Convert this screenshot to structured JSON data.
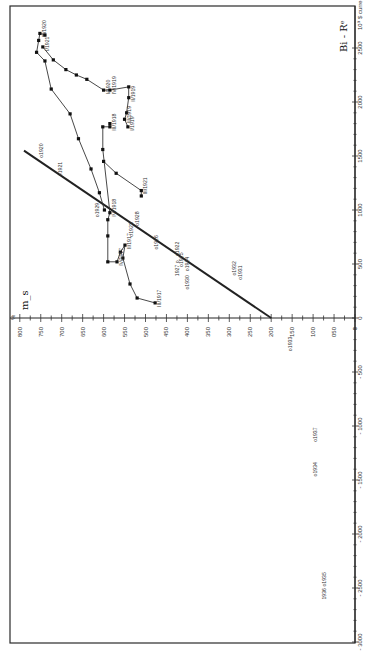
{
  "chart_data": {
    "type": "line",
    "orientation": "rotated-90-ccw",
    "title": "",
    "xlabel": "Bi - R^e  (× 10^9)",
    "ylabel": "m_s (%)",
    "x_axis": {
      "label": "Bi - Rᵉ",
      "unit_label": "10⁹ $ current",
      "ticks": [
        2500,
        2000,
        1500,
        1000,
        500,
        0,
        -500,
        -1000,
        -1500,
        -2000,
        -2500,
        -3000
      ],
      "tick_labels": [
        "2500",
        "2000",
        "1500",
        "1000",
        "500",
        "0",
        "- 500",
        "- 1000",
        "- 1500",
        "- 2000",
        "- 2500",
        "- 3000"
      ],
      "range": [
        -3000,
        2600
      ]
    },
    "y_axis": {
      "label": "m_s",
      "unit_label": "%",
      "ticks": [
        800,
        750,
        700,
        650,
        600,
        550,
        500,
        450,
        400,
        350,
        300,
        250,
        200,
        150,
        100,
        50,
        0
      ],
      "tick_labels": [
        "800",
        "750",
        "700",
        "650",
        "600",
        "550",
        "500",
        "450",
        "400",
        "350",
        "300",
        "250",
        "200",
        "150",
        "100",
        "050",
        "0"
      ],
      "range": [
        0,
        800
      ]
    },
    "reference_line": {
      "from": {
        "x": 0,
        "y": 200
      },
      "to": {
        "x": 1550,
        "y": 790
      }
    },
    "series": [
      {
        "name": "trajectory 1917-1921",
        "points": [
          {
            "x": 140,
            "y": 477,
            "label": "III/1917"
          },
          {
            "x": 185,
            "y": 520
          },
          {
            "x": 315,
            "y": 537
          },
          {
            "x": 555,
            "y": 554
          },
          {
            "x": 675,
            "y": 549,
            "label": "II/1917"
          },
          {
            "x": 610,
            "y": 560
          },
          {
            "x": 520,
            "y": 568,
            "label": "IV/1917"
          },
          {
            "x": 520,
            "y": 590
          },
          {
            "x": 760,
            "y": 590
          },
          {
            "x": 910,
            "y": 590
          },
          {
            "x": 975,
            "y": 585,
            "label": "IV/1918"
          },
          {
            "x": 1560,
            "y": 602
          },
          {
            "x": 1770,
            "y": 602
          },
          {
            "x": 1770,
            "y": 585,
            "label": "III/1918"
          },
          {
            "x": 1800,
            "y": 585
          }
        ]
      },
      {
        "name": "trajectory 1918-1921",
        "points": [
          {
            "x": 1000,
            "y": 598
          },
          {
            "x": 1160,
            "y": 610
          },
          {
            "x": 1380,
            "y": 630
          },
          {
            "x": 1660,
            "y": 660
          },
          {
            "x": 1890,
            "y": 680
          },
          {
            "x": 2120,
            "y": 725
          },
          {
            "x": 2380,
            "y": 740
          },
          {
            "x": 2460,
            "y": 760
          },
          {
            "x": 2570,
            "y": 755
          },
          {
            "x": 2635,
            "y": 752,
            "label": "III/1920"
          },
          {
            "x": 2620,
            "y": 740
          }
        ]
      },
      {
        "name": "trajectory 1919-1920",
        "points": [
          {
            "x": 2510,
            "y": 745,
            "label": "I/1921"
          },
          {
            "x": 2390,
            "y": 720
          },
          {
            "x": 2300,
            "y": 690
          },
          {
            "x": 2250,
            "y": 665
          },
          {
            "x": 2210,
            "y": 640
          },
          {
            "x": 2110,
            "y": 600,
            "label": "I/1920"
          },
          {
            "x": 2110,
            "y": 585,
            "label": "IV/1919"
          },
          {
            "x": 2140,
            "y": 540
          },
          {
            "x": 2040,
            "y": 540,
            "label": "II/1919"
          },
          {
            "x": 1900,
            "y": 545
          },
          {
            "x": 1840,
            "y": 550,
            "label": "III/1919"
          },
          {
            "x": 1770,
            "y": 542,
            "label": "I/1919"
          }
        ]
      },
      {
        "name": "trajectory 1921",
        "points": [
          {
            "x": 1450,
            "y": 600
          },
          {
            "x": 1340,
            "y": 570
          },
          {
            "x": 1180,
            "y": 510,
            "label": "III/1921"
          },
          {
            "x": 1130,
            "y": 510
          }
        ]
      }
    ],
    "annotations": [
      {
        "text": "o1920",
        "x": 1550,
        "y": 745
      },
      {
        "text": "o1921",
        "x": 1380,
        "y": 700
      },
      {
        "text": "o1929",
        "x": 1000,
        "y": 610
      },
      {
        "text": "o1928",
        "x": 920,
        "y": 515
      },
      {
        "text": "o1923",
        "x": 820,
        "y": 530
      },
      {
        "text": "o1926",
        "x": 700,
        "y": 470
      },
      {
        "text": "o1922",
        "x": 640,
        "y": 420
      },
      {
        "text": "o1925",
        "x": 540,
        "y": 410
      },
      {
        "text": "1927 o",
        "x": 460,
        "y": 420
      },
      {
        "text": "o1924",
        "x": 500,
        "y": 395
      },
      {
        "text": "o1930",
        "x": 330,
        "y": 395
      },
      {
        "text": "o1932",
        "x": 460,
        "y": 285
      },
      {
        "text": "o1931",
        "x": 420,
        "y": 270
      },
      {
        "text": "o1933",
        "x": -240,
        "y": 150
      },
      {
        "text": "o1937",
        "x": -1080,
        "y": 90
      },
      {
        "text": "o1934",
        "x": -1400,
        "y": 90
      },
      {
        "text": "1936 o1935",
        "x": -2480,
        "y": 70
      }
    ],
    "grid": false,
    "legend": null
  }
}
